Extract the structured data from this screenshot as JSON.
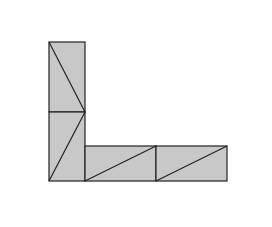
{
  "diagram": {
    "fill": "#c8c8c8",
    "stroke": "#222222",
    "background": "#ffffff",
    "rects": [
      {
        "id": "vertical-top",
        "x": 49,
        "y": 42,
        "w": 36,
        "h": 70,
        "diag": [
          49,
          42,
          85,
          112
        ]
      },
      {
        "id": "vertical-bottom",
        "x": 49,
        "y": 112,
        "w": 36,
        "h": 69,
        "diag": [
          85,
          112,
          49,
          181
        ]
      },
      {
        "id": "horizontal-left",
        "x": 85,
        "y": 146,
        "w": 71,
        "h": 35,
        "diag": [
          85,
          181,
          156,
          146
        ]
      },
      {
        "id": "horizontal-right",
        "x": 156,
        "y": 146,
        "w": 71,
        "h": 35,
        "diag": [
          156,
          181,
          227,
          146
        ]
      }
    ]
  }
}
